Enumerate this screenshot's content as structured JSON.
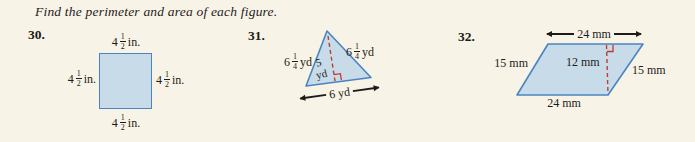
{
  "title": "Find the perimeter and area of each figure.",
  "colors": {
    "background": "#f8f3e7",
    "shape_fill": "#c8dbe9",
    "shape_stroke": "#4a85c2",
    "dashed_red": "#c23b32",
    "text": "#1e1c1a"
  },
  "problems": {
    "p30": {
      "number": "30.",
      "shape": "square",
      "sides": {
        "top": {
          "whole": "4",
          "num": "1",
          "den": "2",
          "unit": "in."
        },
        "left": {
          "whole": "4",
          "num": "1",
          "den": "2",
          "unit": "in."
        },
        "right": {
          "whole": "4",
          "num": "1",
          "den": "2",
          "unit": "in."
        },
        "bottom": {
          "whole": "4",
          "num": "1",
          "den": "2",
          "unit": "in."
        }
      }
    },
    "p31": {
      "number": "31.",
      "shape": "triangle",
      "left_side": {
        "whole": "6",
        "num": "1",
        "den": "4",
        "unit": "yd"
      },
      "right_side": {
        "whole": "6",
        "num": "1",
        "den": "4",
        "unit": "yd"
      },
      "height_value": "5",
      "height_unit": "yd",
      "base": "6 yd"
    },
    "p32": {
      "number": "32.",
      "shape": "parallelogram",
      "top": "24 mm",
      "bottom": "24 mm",
      "left": "15 mm",
      "right": "15 mm",
      "height": "12 mm"
    }
  }
}
